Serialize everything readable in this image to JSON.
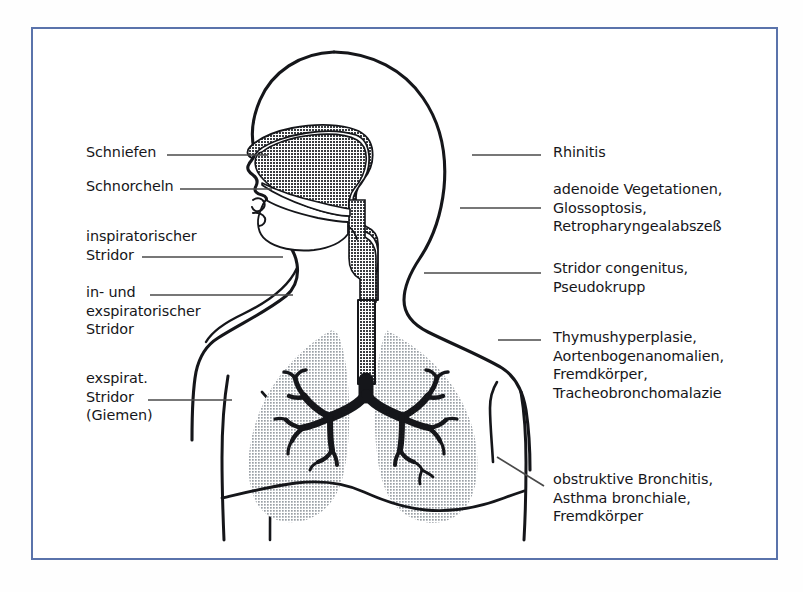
{
  "figure": {
    "frame_color": "#5a73ab",
    "background_color": "#ffffff",
    "ink_color": "#16161a",
    "lung_fill_color": "#c6cace",
    "airway_fill_color": "#5e6166",
    "leader_color": "#4a4a4a"
  },
  "left_labels": [
    {
      "id": "schniefen",
      "text": "Schniefen",
      "x": 86,
      "y": 143
    },
    {
      "id": "schnorcheln",
      "text": "Schnorcheln",
      "x": 86,
      "y": 177
    },
    {
      "id": "insp-stridor",
      "text": "inspiratorischer\nStridor",
      "x": 86,
      "y": 227
    },
    {
      "id": "in-exsp-stridor",
      "text": "in- und\nexspiratorischer\nStridor",
      "x": 86,
      "y": 283
    },
    {
      "id": "exsp-stridor",
      "text": "exspirat.\nStridor\n(Giemen)",
      "x": 86,
      "y": 369
    }
  ],
  "right_labels": [
    {
      "id": "rhinitis",
      "text": "Rhinitis",
      "x": 553,
      "y": 143
    },
    {
      "id": "adenoide",
      "text": "adenoide Vegetationen,\nGlossoptosis,\nRetropharyngealabszeß",
      "x": 553,
      "y": 180
    },
    {
      "id": "stridor-cong",
      "text": "Stridor congenitus,\nPseudokrupp",
      "x": 553,
      "y": 259
    },
    {
      "id": "thymus",
      "text": "Thymushyperplasie,\nAortenbogenanomalien,\nFremdkörper,\nTracheobronchomalazie",
      "x": 553,
      "y": 328
    },
    {
      "id": "obstruktiv",
      "text": "obstruktive Bronchitis,\nAsthma bronchiale,\nFremdkörper",
      "x": 553,
      "y": 470
    }
  ],
  "anatomy": {
    "head_label": "head-profile",
    "nasal_cavity_label": "nasal-cavity",
    "pharynx_label": "pharynx",
    "trachea_label": "trachea",
    "left_lung_label": "left-lung",
    "right_lung_label": "right-lung",
    "bronchial_tree_label": "bronchial-tree",
    "diaphragm_label": "diaphragm",
    "torso_label": "torso-outline"
  },
  "leader_lines": {
    "left": [
      {
        "id": "leader-schniefen",
        "x1": 167,
        "y1": 155,
        "x2": 268,
        "y2": 155
      },
      {
        "id": "leader-schnorcheln",
        "x1": 180,
        "y1": 189,
        "x2": 272,
        "y2": 189
      },
      {
        "id": "leader-insp",
        "x1": 142,
        "y1": 257,
        "x2": 283,
        "y2": 257
      },
      {
        "id": "leader-inexsp",
        "x1": 150,
        "y1": 295,
        "x2": 293,
        "y2": 295
      },
      {
        "id": "leader-exsp",
        "x1": 148,
        "y1": 400,
        "x2": 232,
        "y2": 400
      }
    ],
    "right": [
      {
        "id": "leader-rhinitis",
        "x1": 472,
        "y1": 155,
        "x2": 541,
        "y2": 155
      },
      {
        "id": "leader-adenoide",
        "x1": 460,
        "y1": 208,
        "x2": 541,
        "y2": 208
      },
      {
        "id": "leader-stridor",
        "x1": 424,
        "y1": 273,
        "x2": 541,
        "y2": 273
      },
      {
        "id": "leader-thymus",
        "x1": 498,
        "y1": 340,
        "x2": 541,
        "y2": 340
      },
      {
        "id": "leader-obstrukt",
        "x1": 497,
        "y1": 457,
        "x2": 544,
        "y2": 486
      }
    ]
  }
}
